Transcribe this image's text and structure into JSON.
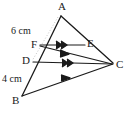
{
  "figure": {
    "background_color": "#ffffff",
    "stroke_color": "#1a1a1a",
    "guide_color": "#bfbfbf",
    "vertices": {
      "A": {
        "label": "A",
        "x": 61,
        "y": 14
      },
      "B": {
        "label": "B",
        "x": 22,
        "y": 98
      },
      "C": {
        "label": "C",
        "x": 113,
        "y": 64
      },
      "D": {
        "label": "D",
        "x": 33,
        "y": 62
      },
      "E": {
        "label": "E",
        "x": 85,
        "y": 45
      },
      "F": {
        "label": "F",
        "x": 40,
        "y": 45
      }
    },
    "measurements": [
      {
        "name": "segment-AF-length",
        "text": "6 cm",
        "unit": "cm",
        "value": 6
      },
      {
        "name": "segment-DB-length",
        "text": "4 cm",
        "unit": "cm",
        "value": 4
      }
    ],
    "segments": [
      {
        "name": "side-AB",
        "from": "A",
        "to": "B",
        "style": "solid"
      },
      {
        "name": "side-AC",
        "from": "A",
        "to": "C",
        "style": "solid"
      },
      {
        "name": "side-BC",
        "from": "B",
        "to": "C",
        "style": "solid",
        "marks": 1
      },
      {
        "name": "segment-FE",
        "from": "F",
        "to": "E",
        "style": "solid",
        "marks": 2
      },
      {
        "name": "segment-FC",
        "from": "F",
        "to": "C",
        "style": "solid",
        "marks": 1
      },
      {
        "name": "segment-DC",
        "from": "D",
        "to": "C",
        "style": "solid",
        "marks": 2
      }
    ],
    "guides": [
      {
        "name": "guide-dotted-A-D",
        "from": "A",
        "to": "D",
        "style": "dotted"
      }
    ],
    "parallel_marks_note": "arrowhead chevrons indicate parallel segments"
  }
}
